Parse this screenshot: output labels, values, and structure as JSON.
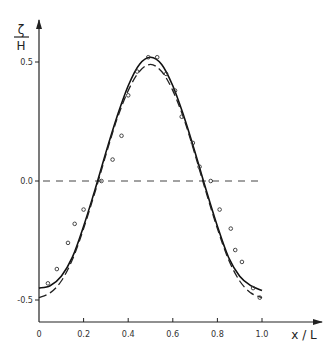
{
  "chart_data": {
    "type": "line",
    "title": "",
    "xlabel": "x / L",
    "ylabel_num": "ζ",
    "ylabel_den": "H",
    "xlim": [
      0,
      1.2
    ],
    "ylim": [
      -0.58,
      0.68
    ],
    "x_ticks": [
      {
        "value": 0,
        "label": "0"
      },
      {
        "value": 0.2,
        "label": "0.2"
      },
      {
        "value": 0.4,
        "label": "0.4"
      },
      {
        "value": 0.6,
        "label": "0.6"
      },
      {
        "value": 0.8,
        "label": "0.8"
      },
      {
        "value": 1.0,
        "label": "1.0"
      }
    ],
    "y_ticks": [
      {
        "value": 0.5,
        "label": "0.5"
      },
      {
        "value": 0.0,
        "label": "0.0"
      },
      {
        "value": -0.5,
        "label": "-0.5"
      }
    ],
    "grid": false,
    "legend": null,
    "reference_line": {
      "y": 0.0,
      "x_range": [
        0,
        1.0
      ],
      "style": "dashed"
    },
    "series": [
      {
        "name": "theory (solid)",
        "style": "solid",
        "x": [
          0,
          0.05,
          0.1,
          0.15,
          0.2,
          0.25,
          0.3,
          0.35,
          0.4,
          0.45,
          0.5,
          0.55,
          0.6,
          0.65,
          0.7,
          0.75,
          0.8,
          0.85,
          0.9,
          0.95,
          1.0
        ],
        "values": [
          -0.45,
          -0.44,
          -0.4,
          -0.32,
          -0.19,
          -0.04,
          0.12,
          0.27,
          0.4,
          0.49,
          0.52,
          0.49,
          0.4,
          0.27,
          0.12,
          -0.04,
          -0.19,
          -0.32,
          -0.4,
          -0.44,
          -0.46
        ]
      },
      {
        "name": "theory (dashed)",
        "style": "dashed",
        "x": [
          0,
          0.05,
          0.1,
          0.15,
          0.2,
          0.25,
          0.3,
          0.35,
          0.4,
          0.45,
          0.5,
          0.55,
          0.6,
          0.65,
          0.7,
          0.75,
          0.8,
          0.85,
          0.9,
          0.95,
          1.0
        ],
        "values": [
          -0.49,
          -0.47,
          -0.42,
          -0.33,
          -0.2,
          -0.05,
          0.11,
          0.26,
          0.38,
          0.46,
          0.49,
          0.46,
          0.38,
          0.26,
          0.11,
          -0.05,
          -0.2,
          -0.33,
          -0.42,
          -0.47,
          -0.49
        ]
      },
      {
        "name": "measurements",
        "style": "markers",
        "x": [
          0.04,
          0.08,
          0.13,
          0.16,
          0.2,
          0.28,
          0.33,
          0.37,
          0.4,
          0.44,
          0.49,
          0.53,
          0.57,
          0.61,
          0.64,
          0.69,
          0.72,
          0.77,
          0.81,
          0.86,
          0.88,
          0.91,
          0.96,
          0.99
        ],
        "values": [
          -0.43,
          -0.37,
          -0.26,
          -0.18,
          -0.12,
          0.0,
          0.09,
          0.19,
          0.36,
          0.46,
          0.52,
          0.52,
          0.45,
          0.38,
          0.27,
          0.16,
          0.06,
          -0.0,
          -0.12,
          -0.2,
          -0.29,
          -0.34,
          -0.45,
          -0.49
        ]
      }
    ]
  }
}
